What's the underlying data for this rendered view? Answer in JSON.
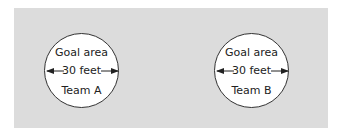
{
  "diagram": {
    "field_color": "#dcdcdc",
    "goals": [
      {
        "title": "Goal area",
        "dimension": "30 feet",
        "team": "Team A"
      },
      {
        "title": "Goal area",
        "dimension": "30 feet",
        "team": "Team B"
      }
    ]
  }
}
